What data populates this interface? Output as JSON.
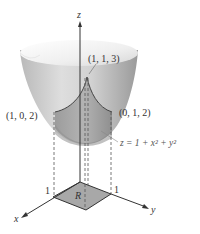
{
  "figure": {
    "axes": {
      "x_label": "x",
      "y_label": "y",
      "z_label": "z"
    },
    "ticks": {
      "x_tick": "1",
      "y_tick": "1"
    },
    "points": [
      {
        "label": "(1, 1, 3)"
      },
      {
        "label": "(1, 0, 2)"
      },
      {
        "label": "(0, 1, 2)"
      }
    ],
    "surface_equation": "z = 1 + x² + y²",
    "region_label": "R",
    "colors": {
      "surface_light": "#e6e6e6",
      "surface_mid": "#c4c4c4",
      "surface_dark": "#8e8e8e",
      "region_fill": "#a8a8a8",
      "line": "#333333"
    }
  }
}
